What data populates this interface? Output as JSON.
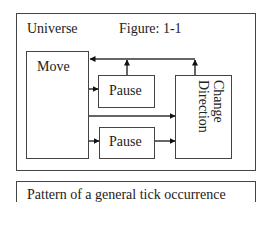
{
  "figure": {
    "container_label": "Universe",
    "figure_label": "Figure: 1-1",
    "nodes": {
      "move": "Move",
      "pause_top": "Pause",
      "pause_bottom": "Pause",
      "change_direction_line1": "Change",
      "change_direction_line2": "Direction"
    },
    "edges": [
      {
        "from": "Move",
        "to": "Pause (top)"
      },
      {
        "from": "Pause (top)",
        "to": "Move"
      },
      {
        "from": "Change Direction",
        "to": "Move"
      },
      {
        "from": "Move",
        "to": "Change Direction"
      },
      {
        "from": "Move",
        "to": "Pause (bottom)"
      },
      {
        "from": "Pause (bottom)",
        "to": "Change Direction"
      }
    ]
  },
  "caption": "Pattern of a general tick occurrence"
}
